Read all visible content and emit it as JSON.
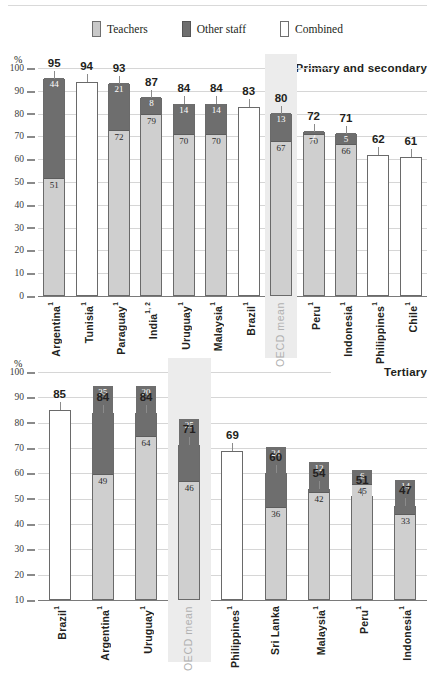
{
  "legend": {
    "items": [
      {
        "key": "teachers",
        "label": "Teachers",
        "color": "#cfcfcf"
      },
      {
        "key": "other",
        "label": "Other staff",
        "color": "#6e6e6e"
      },
      {
        "key": "combined",
        "label": "Combined",
        "color": "#ffffff"
      }
    ]
  },
  "axis": {
    "unit": "%",
    "ticks_primary": [
      "100",
      "90",
      "80",
      "70",
      "60",
      "50",
      "40",
      "30",
      "20",
      "10",
      "0"
    ],
    "ticks_tertiary": [
      "100",
      "90",
      "80",
      "70",
      "60",
      "50",
      "40",
      "30",
      "20",
      "10"
    ]
  },
  "highlight": {
    "label": "OECD mean",
    "color": "#ececec"
  },
  "chart_data": [
    {
      "type": "bar",
      "title": "Primary and secondary",
      "subtype": "stacked",
      "xlabel": "",
      "ylabel": "%",
      "ylim": [
        0,
        100
      ],
      "ytick_step": 10,
      "grid": true,
      "legend_position": "top-center",
      "categories": [
        "Argentina¹",
        "Tunisia¹",
        "Paraguay¹",
        "India¹·²",
        "Uruguay¹",
        "Malaysia¹",
        "Brazil¹",
        "OECD mean",
        "Peru¹",
        "Indonesia¹",
        "Philippines¹",
        "Chile¹"
      ],
      "series": [
        {
          "name": "Teachers",
          "values": [
            51,
            null,
            72,
            79,
            70,
            70,
            null,
            67,
            70,
            66,
            null,
            null
          ]
        },
        {
          "name": "Other staff",
          "values": [
            44,
            null,
            21,
            8,
            14,
            14,
            null,
            13,
            2,
            5,
            null,
            null
          ]
        },
        {
          "name": "Combined",
          "values": [
            null,
            94,
            null,
            null,
            null,
            null,
            83,
            null,
            null,
            null,
            62,
            61
          ]
        }
      ],
      "totals": [
        95,
        94,
        93,
        87,
        84,
        84,
        83,
        80,
        72,
        71,
        62,
        61
      ],
      "highlight_category": "OECD mean"
    },
    {
      "type": "bar",
      "title": "Tertiary",
      "subtype": "stacked",
      "xlabel": "",
      "ylabel": "%",
      "ylim": [
        10,
        100
      ],
      "ytick_step": 10,
      "grid": true,
      "legend_position": "top-center",
      "categories": [
        "Brazil¹",
        "Argentina¹",
        "Uruguay¹",
        "OECD mean",
        "Philippines¹",
        "Sri Lanka",
        "Malaysia¹",
        "Peru¹",
        "Indonesia¹"
      ],
      "series": [
        {
          "name": "Teachers",
          "values": [
            null,
            49,
            64,
            46,
            null,
            36,
            42,
            45,
            33
          ]
        },
        {
          "name": "Other staff",
          "values": [
            null,
            35,
            20,
            25,
            null,
            24,
            12,
            6,
            14
          ]
        },
        {
          "name": "Combined",
          "values": [
            85,
            null,
            null,
            null,
            69,
            null,
            null,
            null,
            null
          ]
        }
      ],
      "totals": [
        85,
        84,
        84,
        71,
        69,
        60,
        54,
        51,
        47
      ],
      "highlight_category": "OECD mean"
    }
  ]
}
